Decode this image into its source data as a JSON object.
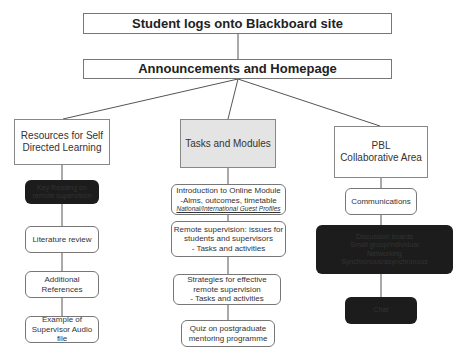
{
  "diagram": {
    "title": "Student logs onto Blackboard site",
    "homepage": "Announcements and Homepage",
    "branches": [
      {
        "label_lines": [
          "Resources for Self",
          "Directed Learning"
        ],
        "items": [
          {
            "lines": [
              "Key Reading on",
              "remote supervision"
            ],
            "style": "dark"
          },
          {
            "lines": [
              "Literature review"
            ],
            "style": "normal"
          },
          {
            "lines": [
              "Additional",
              "References"
            ],
            "style": "normal"
          },
          {
            "lines": [
              "Example of",
              "Supervisor Audio file"
            ],
            "style": "normal"
          }
        ]
      },
      {
        "label_lines": [
          "Tasks and Modules"
        ],
        "items": [
          {
            "lines": [
              "Introduction to Online Module",
              "-Aims, outcomes, timetable"
            ],
            "note": "National/International Guest Profiles",
            "style": "normal"
          },
          {
            "lines": [
              "Remote supervision: issues for",
              "students and supervisors",
              "- Tasks and activities"
            ],
            "style": "normal"
          },
          {
            "lines": [
              "Strategies for effective",
              "remote supervision",
              "- Tasks and activities"
            ],
            "style": "normal"
          },
          {
            "lines": [
              "Quiz on postgraduate",
              "mentoring programme"
            ],
            "style": "normal"
          }
        ]
      },
      {
        "label_lines": [
          "PBL",
          "Collaborative Area"
        ],
        "items": [
          {
            "lines": [
              "Communications"
            ],
            "style": "normal"
          },
          {
            "lines": [
              "Discussion boards",
              "Small group/individual",
              "Networking",
              "Synchronous/asynchronous"
            ],
            "style": "dark"
          },
          {
            "lines": [
              "Chat"
            ],
            "style": "dark"
          }
        ]
      }
    ]
  }
}
